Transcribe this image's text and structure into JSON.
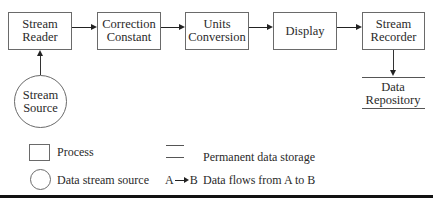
{
  "diagram": {
    "nodes": {
      "stream_reader": {
        "line1": "Stream",
        "line2": "Reader",
        "shape": "process"
      },
      "correction_constant": {
        "line1": "Correction",
        "line2": "Constant",
        "shape": "process"
      },
      "units_conversion": {
        "line1": "Units",
        "line2": "Conversion",
        "shape": "process"
      },
      "display": {
        "line1": "Display",
        "shape": "process"
      },
      "stream_recorder": {
        "line1": "Stream",
        "line2": "Recorder",
        "shape": "process"
      },
      "stream_source": {
        "line1": "Stream",
        "line2": "Source",
        "shape": "data-stream-source"
      },
      "data_repository": {
        "line1": "Data",
        "line2": "Repository",
        "shape": "permanent-data-storage"
      }
    },
    "edges": [
      {
        "from": "Stream Source",
        "to": "Stream Reader"
      },
      {
        "from": "Stream Reader",
        "to": "Correction Constant"
      },
      {
        "from": "Correction Constant",
        "to": "Units Conversion"
      },
      {
        "from": "Units Conversion",
        "to": "Display"
      },
      {
        "from": "Display",
        "to": "Stream Recorder"
      },
      {
        "from": "Stream Recorder",
        "to": "Data Repository"
      }
    ]
  },
  "legend": {
    "process": "Process",
    "storage": "Permanent data storage",
    "source": "Data stream source",
    "flow_a": "A",
    "flow_b": "B",
    "flow": "Data flows from A to B"
  }
}
